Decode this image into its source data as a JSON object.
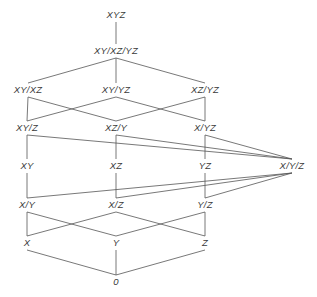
{
  "diagram": {
    "type": "hasse-lattice",
    "title": "",
    "width": 317,
    "height": 297,
    "style": {
      "edge_color": "#555555",
      "edge_width": 0.8,
      "label_color": "#3a3a3a",
      "background": "#ffffff",
      "font_style": "italic",
      "font_size_px": 9.5
    },
    "nodes": [
      {
        "id": "XYZ",
        "label": "XYZ",
        "x": 116,
        "y": 15,
        "rank": 0
      },
      {
        "id": "XY_XZ_YZ",
        "label": "XY/XZ/YZ",
        "x": 116,
        "y": 51,
        "rank": 1
      },
      {
        "id": "XY_XZ",
        "label": "XY/XZ",
        "x": 28,
        "y": 90,
        "rank": 2
      },
      {
        "id": "XY_YZ",
        "label": "XY/YZ",
        "x": 116,
        "y": 90,
        "rank": 2
      },
      {
        "id": "XZ_YZ",
        "label": "XZ/YZ",
        "x": 205,
        "y": 90,
        "rank": 2
      },
      {
        "id": "XY_Z",
        "label": "XY/Z",
        "x": 27,
        "y": 128,
        "rank": 3
      },
      {
        "id": "XZ_Y",
        "label": "XZ/Y",
        "x": 116,
        "y": 128,
        "rank": 3
      },
      {
        "id": "X_YZ",
        "label": "X/YZ",
        "x": 205,
        "y": 128,
        "rank": 3
      },
      {
        "id": "XY",
        "label": "XY",
        "x": 27,
        "y": 166,
        "rank": 4
      },
      {
        "id": "XZ",
        "label": "XZ",
        "x": 116,
        "y": 166,
        "rank": 4
      },
      {
        "id": "YZ",
        "label": "YZ",
        "x": 205,
        "y": 166,
        "rank": 4
      },
      {
        "id": "X_Y_Z",
        "label": "X/Y/Z",
        "x": 292,
        "y": 166,
        "rank": 4
      },
      {
        "id": "X_Y",
        "label": "X/Y",
        "x": 27,
        "y": 205,
        "rank": 5
      },
      {
        "id": "X_Z",
        "label": "X/Z",
        "x": 116,
        "y": 205,
        "rank": 5
      },
      {
        "id": "Y_Z",
        "label": "Y/Z",
        "x": 205,
        "y": 205,
        "rank": 5
      },
      {
        "id": "X",
        "label": "X",
        "x": 27,
        "y": 243,
        "rank": 6
      },
      {
        "id": "Y",
        "label": "Y",
        "x": 116,
        "y": 243,
        "rank": 6
      },
      {
        "id": "Z",
        "label": "Z",
        "x": 205,
        "y": 243,
        "rank": 6
      },
      {
        "id": "ZERO",
        "label": "0",
        "x": 116,
        "y": 282,
        "rank": 7
      }
    ],
    "edges": [
      {
        "from": "XYZ",
        "to": "XY_XZ_YZ"
      },
      {
        "from": "XY_XZ_YZ",
        "to": "XY_XZ"
      },
      {
        "from": "XY_XZ_YZ",
        "to": "XY_YZ"
      },
      {
        "from": "XY_XZ_YZ",
        "to": "XZ_YZ"
      },
      {
        "from": "XY_XZ",
        "to": "XY_Z"
      },
      {
        "from": "XY_XZ",
        "to": "XZ_Y"
      },
      {
        "from": "XY_YZ",
        "to": "XY_Z"
      },
      {
        "from": "XY_YZ",
        "to": "X_YZ"
      },
      {
        "from": "XZ_YZ",
        "to": "XZ_Y"
      },
      {
        "from": "XZ_YZ",
        "to": "X_YZ"
      },
      {
        "from": "XY_Z",
        "to": "XY"
      },
      {
        "from": "XZ_Y",
        "to": "XZ"
      },
      {
        "from": "X_YZ",
        "to": "YZ"
      },
      {
        "from": "XY_Z",
        "to": "X_Y_Z"
      },
      {
        "from": "XZ_Y",
        "to": "X_Y_Z"
      },
      {
        "from": "X_YZ",
        "to": "X_Y_Z"
      },
      {
        "from": "XY",
        "to": "X_Y"
      },
      {
        "from": "XZ",
        "to": "X_Z"
      },
      {
        "from": "YZ",
        "to": "Y_Z"
      },
      {
        "from": "X_Y_Z",
        "to": "X_Y"
      },
      {
        "from": "X_Y_Z",
        "to": "X_Z"
      },
      {
        "from": "X_Y_Z",
        "to": "Y_Z"
      },
      {
        "from": "X_Y",
        "to": "X"
      },
      {
        "from": "X_Y",
        "to": "Y"
      },
      {
        "from": "X_Z",
        "to": "X"
      },
      {
        "from": "X_Z",
        "to": "Z"
      },
      {
        "from": "Y_Z",
        "to": "Y"
      },
      {
        "from": "Y_Z",
        "to": "Z"
      },
      {
        "from": "X",
        "to": "ZERO"
      },
      {
        "from": "Y",
        "to": "ZERO"
      },
      {
        "from": "Z",
        "to": "ZERO"
      }
    ]
  }
}
